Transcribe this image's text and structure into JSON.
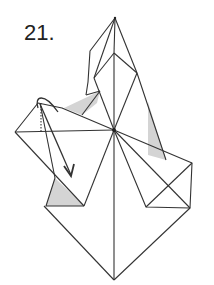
{
  "step": {
    "number_label": "21."
  },
  "diagram": {
    "line_color": "#333333",
    "shade_color": "#d4d4d4",
    "background": "#ffffff",
    "arrow": "fold-flap-down-arrow"
  }
}
